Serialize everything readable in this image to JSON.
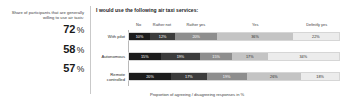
{
  "left_panel": {
    "caption": "Share of participants that are generally willing to use air taxis:",
    "values": [
      {
        "value": "72",
        "unit": "%"
      },
      {
        "value": "58",
        "unit": "%"
      },
      {
        "value": "57",
        "unit": "%"
      }
    ]
  },
  "chart_data": {
    "type": "bar",
    "orientation": "horizontal-stacked",
    "title": "I would use the following air taxi services:",
    "xlabel": "Proportion of agreeing / disagreeing responses in %",
    "ylabel": "",
    "xlim": [
      0,
      100
    ],
    "grid": false,
    "legend_position": "top",
    "categories": [
      "With pilot",
      "Autonomous",
      "Remote controlled"
    ],
    "legend": [
      "No",
      "Rather not",
      "Rather yes",
      "Yes",
      "Definitly yes"
    ],
    "series": [
      {
        "name": "No",
        "values": [
          10,
          15,
          20
        ],
        "color": "#1c1c1c"
      },
      {
        "name": "Rather not",
        "values": [
          12,
          19,
          17
        ],
        "color": "#3c3c3c"
      },
      {
        "name": "Rather yes",
        "values": [
          20,
          15,
          19
        ],
        "color": "#8e8e8e"
      },
      {
        "name": "Yes",
        "values": [
          36,
          17,
          26
        ],
        "color": "#c4c4c4"
      },
      {
        "name": "Definitly yes",
        "values": [
          22,
          34,
          18
        ],
        "color": "#ececec"
      }
    ],
    "rows": [
      {
        "label": "With pilot",
        "segments": [
          {
            "key": "No",
            "value": 10,
            "label": "10%"
          },
          {
            "key": "Rather not",
            "value": 12,
            "label": "12%"
          },
          {
            "key": "Rather yes",
            "value": 20,
            "label": "20%"
          },
          {
            "key": "Yes",
            "value": 36,
            "label": "36%"
          },
          {
            "key": "Definitly yes",
            "value": 22,
            "label": "22%"
          }
        ]
      },
      {
        "label": "Autonomous",
        "segments": [
          {
            "key": "No",
            "value": 15,
            "label": "15%"
          },
          {
            "key": "Rather not",
            "value": 19,
            "label": "19%"
          },
          {
            "key": "Rather yes",
            "value": 15,
            "label": "15%"
          },
          {
            "key": "Yes",
            "value": 17,
            "label": "17%"
          },
          {
            "key": "Definitly yes",
            "value": 34,
            "label": "34%"
          }
        ]
      },
      {
        "label": "Remote controlled",
        "segments": [
          {
            "key": "No",
            "value": 20,
            "label": "20%"
          },
          {
            "key": "Rather not",
            "value": 17,
            "label": "17%"
          },
          {
            "key": "Rather yes",
            "value": 19,
            "label": "19%"
          },
          {
            "key": "Yes",
            "value": 26,
            "label": "26%"
          },
          {
            "key": "Definitly yes",
            "value": 18,
            "label": "18%"
          }
        ]
      }
    ]
  }
}
